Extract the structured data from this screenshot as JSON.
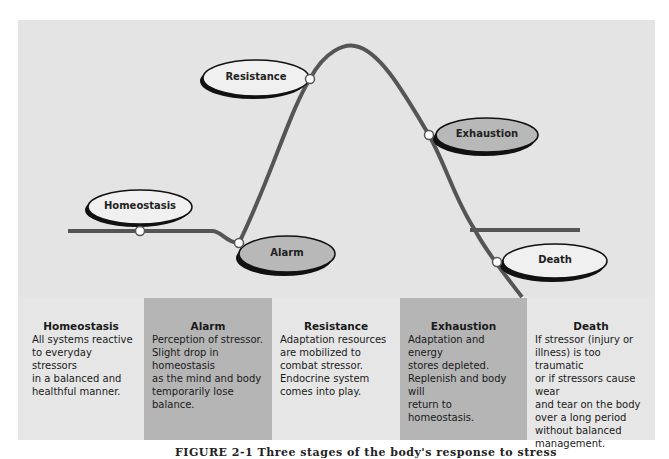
{
  "diagram": {
    "type": "stress-response-curve",
    "stages": [
      {
        "id": "homeostasis",
        "label": "Homeostasis",
        "fill": "#f0f0f0"
      },
      {
        "id": "alarm",
        "label": "Alarm",
        "fill": "#b8b8b8"
      },
      {
        "id": "resistance",
        "label": "Resistance",
        "fill": "#f0f0f0"
      },
      {
        "id": "exhaustion",
        "label": "Exhaustion",
        "fill": "#b8b8b8"
      },
      {
        "id": "death",
        "label": "Death",
        "fill": "#f0f0f0"
      }
    ]
  },
  "columns": [
    {
      "title": "Homeostasis",
      "text": "All systems reactive\nto everyday stressors\nin a balanced and\nhealthful manner."
    },
    {
      "title": "Alarm",
      "text": "Perception of stressor.\nSlight drop in homeostasis\nas the mind and body\ntemporarily lose balance."
    },
    {
      "title": "Resistance",
      "text": "Adaptation resources\nare mobilized to\ncombat stressor.\nEndocrine system\ncomes into play."
    },
    {
      "title": "Exhaustion",
      "text": "Adaptation and energy\nstores depleted.\nReplenish and body will\nreturn to homeostasis."
    },
    {
      "title": "Death",
      "text": "If stressor (injury or\nillness) is too traumatic\nor if stressors cause wear\nand tear on the body\nover a long period\nwithout balanced\nmanagement."
    }
  ],
  "caption": "FIGURE 2-1 Three stages of the body's response to stress",
  "colors": {
    "panel": "#e4e4e4",
    "dark_column": "#b5b5b5",
    "curve": "#555555"
  }
}
